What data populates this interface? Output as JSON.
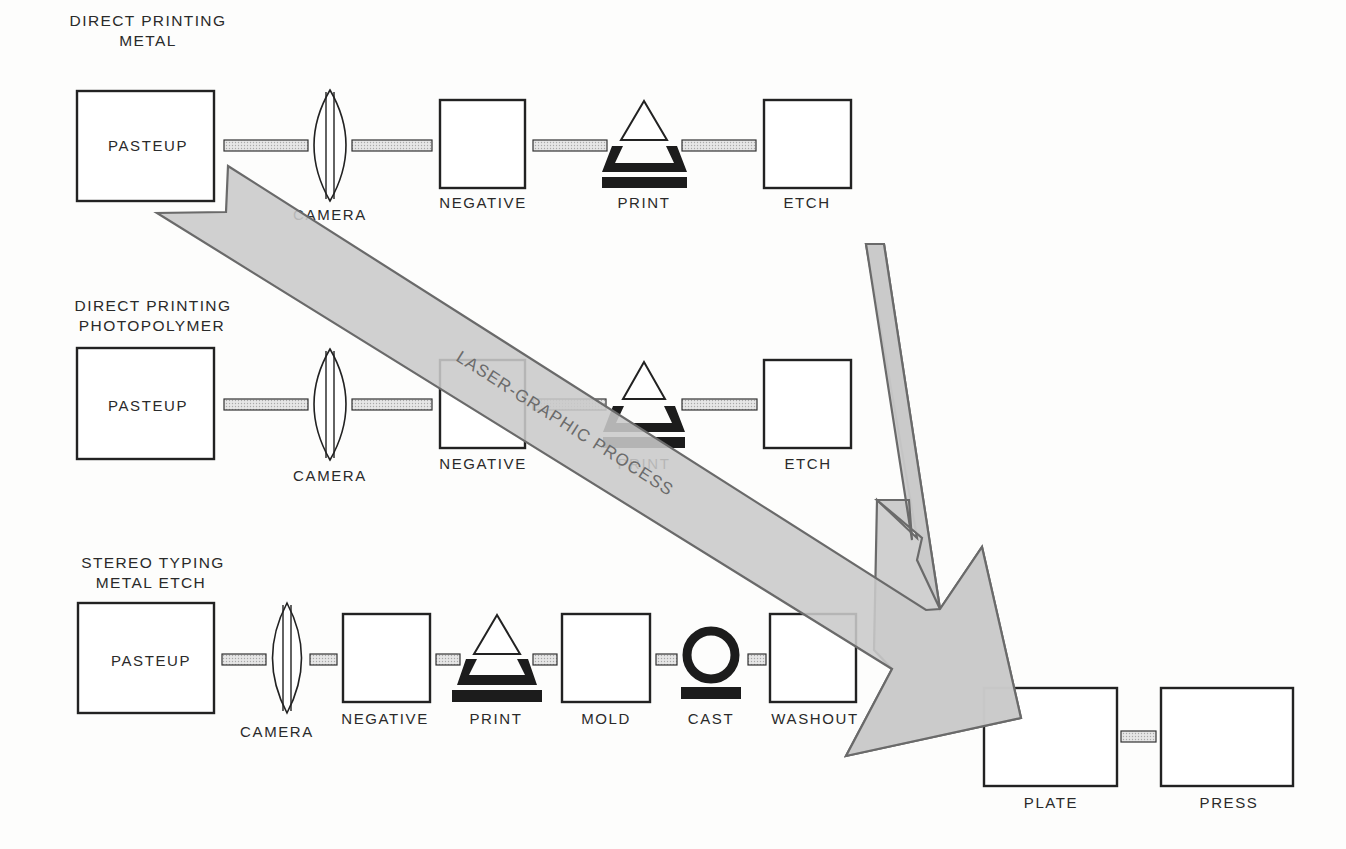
{
  "diagram": {
    "colors": {
      "ink": "#222222",
      "arrow_fill": "#c9c9c9",
      "arrow_stroke": "#6a6a6a",
      "connector_fill": "#dcdcdc",
      "background": "#fdfdfc"
    },
    "rows": [
      {
        "id": "direct-printing-metal",
        "title_line1": "DIRECT PRINTING",
        "title_line2": "METAL",
        "steps": [
          {
            "label": "PASTEUP",
            "shape": "box"
          },
          {
            "label": "CAMERA",
            "shape": "lens"
          },
          {
            "label": "NEGATIVE",
            "shape": "box"
          },
          {
            "label": "PRINT",
            "shape": "print-icon"
          },
          {
            "label": "ETCH",
            "shape": "box"
          }
        ]
      },
      {
        "id": "direct-printing-photopolymer",
        "title_line1": "DIRECT PRINTING",
        "title_line2": "PHOTOPOLYMER",
        "steps": [
          {
            "label": "PASTEUP",
            "shape": "box"
          },
          {
            "label": "CAMERA",
            "shape": "lens"
          },
          {
            "label": "NEGATIVE",
            "shape": "box"
          },
          {
            "label": "PRINT",
            "shape": "print-icon"
          },
          {
            "label": "ETCH",
            "shape": "box"
          }
        ]
      },
      {
        "id": "stereo-typing-metal-etch",
        "title_line1": "STEREO TYPING",
        "title_line2": "METAL ETCH",
        "steps": [
          {
            "label": "PASTEUP",
            "shape": "box"
          },
          {
            "label": "CAMERA",
            "shape": "lens"
          },
          {
            "label": "NEGATIVE",
            "shape": "box"
          },
          {
            "label": "PRINT",
            "shape": "print-icon"
          },
          {
            "label": "MOLD",
            "shape": "box"
          },
          {
            "label": "CAST",
            "shape": "cast-icon"
          },
          {
            "label": "WASHOUT",
            "shape": "box"
          }
        ]
      }
    ],
    "final_steps": [
      {
        "label": "PLATE",
        "shape": "box"
      },
      {
        "label": "PRESS",
        "shape": "box"
      }
    ],
    "laser_arrow": {
      "label": "LASER-GRAPHIC PROCESS",
      "from": "PASTEUP (Direct Printing Metal)",
      "to": "PLATE"
    },
    "vertical_arrow": {
      "from": "ETCH (Direct Printing Metal)",
      "to": "PLATE"
    }
  }
}
